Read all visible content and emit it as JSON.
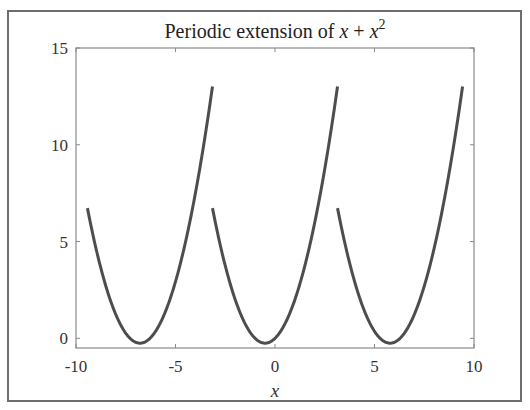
{
  "chart_data": {
    "type": "line",
    "title_parts": {
      "prefix": "Periodic extension of ",
      "var1": "x",
      "op": " + ",
      "var2": "x",
      "exp": "2"
    },
    "xlabel": "x",
    "ylabel": "",
    "xlim": [
      -10,
      10
    ],
    "ylim": [
      -0.5,
      15
    ],
    "xticks": [
      -10,
      -5,
      0,
      5,
      10
    ],
    "xtick_labels": [
      "-10",
      "-5",
      "0",
      "5",
      "10"
    ],
    "yticks": [
      0,
      5,
      10,
      15
    ],
    "ytick_labels": [
      "0",
      "5",
      "10",
      "15"
    ],
    "grid": false,
    "legend": null,
    "series": [
      {
        "name": "periodic extension of x + x^2 (period 2π)",
        "function": "x + x^2 on [-pi, pi], repeated with period 2pi",
        "segments": [
          {
            "x_start": -9.425,
            "x_end": -3.142,
            "y_start": 6.73,
            "y_min": -0.25,
            "x_at_min": -6.783,
            "y_end": 13.01
          },
          {
            "x_start": -3.142,
            "x_end": 3.142,
            "y_start": 6.73,
            "y_min": -0.25,
            "x_at_min": -0.5,
            "y_end": 13.01
          },
          {
            "x_start": 3.142,
            "x_end": 9.425,
            "y_start": 6.73,
            "y_min": -0.25,
            "x_at_min": 5.783,
            "y_end": 13.01
          }
        ],
        "color": "#4d4d4d"
      }
    ]
  },
  "colors": {
    "line": "#4d4d4d",
    "axes": "#8a8a8a",
    "frame": "#6e6e6e"
  }
}
